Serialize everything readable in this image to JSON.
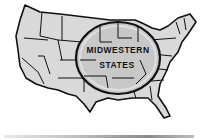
{
  "illustration": {
    "subject": "map-of-united-states",
    "lens_label_line1": "MIDWESTERN",
    "lens_label_line2": "STATES",
    "colors": {
      "map_fill": "#d9d9d9",
      "outline": "#111111",
      "lens_fill": "#c8c8c8",
      "background": "#ffffff"
    }
  }
}
